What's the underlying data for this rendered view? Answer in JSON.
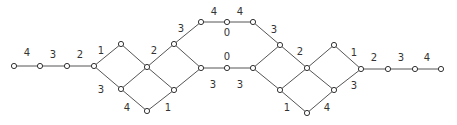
{
  "diagram": {
    "type": "graph",
    "colors": {
      "edge": "#555555",
      "node_stroke": "#333333",
      "label": "#333333",
      "background": "#ffffff"
    },
    "nodes": [
      {
        "id": "n0",
        "x": 14,
        "y": 66
      },
      {
        "id": "n1",
        "x": 40,
        "y": 66
      },
      {
        "id": "n2",
        "x": 67,
        "y": 66
      },
      {
        "id": "n3",
        "x": 94,
        "y": 66
      },
      {
        "id": "n4",
        "x": 121,
        "y": 44
      },
      {
        "id": "n5",
        "x": 121,
        "y": 89
      },
      {
        "id": "n6",
        "x": 147,
        "y": 67
      },
      {
        "id": "n7",
        "x": 147,
        "y": 111
      },
      {
        "id": "n8",
        "x": 174,
        "y": 44
      },
      {
        "id": "n9",
        "x": 174,
        "y": 90
      },
      {
        "id": "n10",
        "x": 201,
        "y": 22
      },
      {
        "id": "n11",
        "x": 201,
        "y": 68
      },
      {
        "id": "n12",
        "x": 227,
        "y": 22
      },
      {
        "id": "n13",
        "x": 227,
        "y": 68
      },
      {
        "id": "n14",
        "x": 253,
        "y": 22
      },
      {
        "id": "n15",
        "x": 253,
        "y": 68
      },
      {
        "id": "n16",
        "x": 280,
        "y": 45
      },
      {
        "id": "n17",
        "x": 280,
        "y": 90
      },
      {
        "id": "n18",
        "x": 307,
        "y": 68
      },
      {
        "id": "n19",
        "x": 307,
        "y": 113
      },
      {
        "id": "n20",
        "x": 334,
        "y": 45
      },
      {
        "id": "n21",
        "x": 334,
        "y": 90
      },
      {
        "id": "n22",
        "x": 361,
        "y": 69
      },
      {
        "id": "n23",
        "x": 388,
        "y": 69
      },
      {
        "id": "n24",
        "x": 415,
        "y": 69
      },
      {
        "id": "n25",
        "x": 441,
        "y": 69
      }
    ],
    "edges": [
      [
        "n0",
        "n1"
      ],
      [
        "n1",
        "n2"
      ],
      [
        "n2",
        "n3"
      ],
      [
        "n3",
        "n4"
      ],
      [
        "n3",
        "n5"
      ],
      [
        "n4",
        "n6"
      ],
      [
        "n5",
        "n6"
      ],
      [
        "n5",
        "n7"
      ],
      [
        "n6",
        "n8"
      ],
      [
        "n6",
        "n9"
      ],
      [
        "n7",
        "n9"
      ],
      [
        "n8",
        "n10"
      ],
      [
        "n8",
        "n11"
      ],
      [
        "n9",
        "n11"
      ],
      [
        "n10",
        "n12"
      ],
      [
        "n12",
        "n14"
      ],
      [
        "n11",
        "n13"
      ],
      [
        "n13",
        "n15"
      ],
      [
        "n14",
        "n16"
      ],
      [
        "n15",
        "n16"
      ],
      [
        "n15",
        "n17"
      ],
      [
        "n16",
        "n18"
      ],
      [
        "n17",
        "n18"
      ],
      [
        "n17",
        "n19"
      ],
      [
        "n18",
        "n20"
      ],
      [
        "n18",
        "n21"
      ],
      [
        "n19",
        "n21"
      ],
      [
        "n20",
        "n22"
      ],
      [
        "n21",
        "n22"
      ],
      [
        "n22",
        "n23"
      ],
      [
        "n23",
        "n24"
      ],
      [
        "n24",
        "n25"
      ]
    ],
    "labels": [
      {
        "text": "4",
        "x": 27,
        "y": 52
      },
      {
        "text": "3",
        "x": 53,
        "y": 54
      },
      {
        "text": "2",
        "x": 80,
        "y": 54
      },
      {
        "text": "1",
        "x": 101,
        "y": 50
      },
      {
        "text": "3",
        "x": 101,
        "y": 89
      },
      {
        "text": "2",
        "x": 154,
        "y": 50
      },
      {
        "text": "4",
        "x": 127,
        "y": 107
      },
      {
        "text": "1",
        "x": 168,
        "y": 107
      },
      {
        "text": "3",
        "x": 181,
        "y": 28
      },
      {
        "text": "4",
        "x": 214,
        "y": 11
      },
      {
        "text": "4",
        "x": 240,
        "y": 11
      },
      {
        "text": "0",
        "x": 227,
        "y": 32
      },
      {
        "text": "0",
        "x": 227,
        "y": 56
      },
      {
        "text": "3",
        "x": 213,
        "y": 84
      },
      {
        "text": "3",
        "x": 240,
        "y": 84
      },
      {
        "text": "3",
        "x": 274,
        "y": 29
      },
      {
        "text": "2",
        "x": 300,
        "y": 51
      },
      {
        "text": "1",
        "x": 287,
        "y": 107
      },
      {
        "text": "4",
        "x": 327,
        "y": 107
      },
      {
        "text": "1",
        "x": 354,
        "y": 52
      },
      {
        "text": "3",
        "x": 354,
        "y": 85
      },
      {
        "text": "2",
        "x": 374,
        "y": 57
      },
      {
        "text": "3",
        "x": 401,
        "y": 57
      },
      {
        "text": "4",
        "x": 427,
        "y": 57
      }
    ]
  }
}
